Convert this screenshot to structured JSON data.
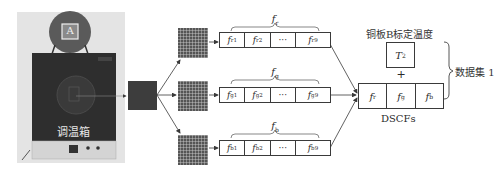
{
  "photo": {
    "chamber_label": "调温箱",
    "lid_marker": "A"
  },
  "feature_groups": [
    {
      "name": "red",
      "brace_label": "f",
      "brace_sub": "r",
      "cells": [
        {
          "label": "f",
          "sub": "r1"
        },
        {
          "label": "f",
          "sub": "r2"
        },
        {
          "label": "···",
          "sub": ""
        },
        {
          "label": "f",
          "sub": "r9"
        }
      ]
    },
    {
      "name": "green",
      "brace_label": "f",
      "brace_sub": "g",
      "cells": [
        {
          "label": "f",
          "sub": "g1"
        },
        {
          "label": "f",
          "sub": "g2"
        },
        {
          "label": "···",
          "sub": ""
        },
        {
          "label": "f",
          "sub": "g9"
        }
      ]
    },
    {
      "name": "blue",
      "brace_label": "f",
      "brace_sub": "b",
      "cells": [
        {
          "label": "f",
          "sub": "b1"
        },
        {
          "label": "f",
          "sub": "b2"
        },
        {
          "label": "···",
          "sub": ""
        },
        {
          "label": "f",
          "sub": "b9"
        }
      ]
    }
  ],
  "output": {
    "calibration_title": "铜板B标定温度",
    "temperature": {
      "label": "T",
      "sub": "2"
    },
    "plus": "+",
    "dscf_cells": [
      {
        "label": "f",
        "sub": "r"
      },
      {
        "label": "f",
        "sub": "g"
      },
      {
        "label": "f",
        "sub": "b"
      }
    ],
    "dscf_label": "DSCFs",
    "dataset_label": "数据集 1"
  },
  "colors": {
    "line": "#3a3a3a",
    "chamber": "#2e2e2e",
    "roi_square": "#3d3d3d",
    "grid_fill": "#555555",
    "grid_line": "#d8d8d8",
    "photo_bg": "#e6e6e6"
  }
}
